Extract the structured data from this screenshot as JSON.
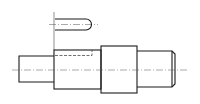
{
  "drawing": {
    "title": "Stepped shaft with keyway (engineering drawing)",
    "parts": [
      {
        "name": "keyway-detail",
        "description": "Rounded-end keyway outline with centerline"
      },
      {
        "name": "left-shaft-segment",
        "description": "Small diameter journal"
      },
      {
        "name": "middle-shaft-segment",
        "description": "Shaft section with hidden keyway"
      },
      {
        "name": "collar",
        "description": "Largest diameter shoulder"
      },
      {
        "name": "right-shaft-segment",
        "description": "Journal with chamfered end"
      }
    ],
    "line_color": "#1a1a1a",
    "background": "#ffffff"
  }
}
